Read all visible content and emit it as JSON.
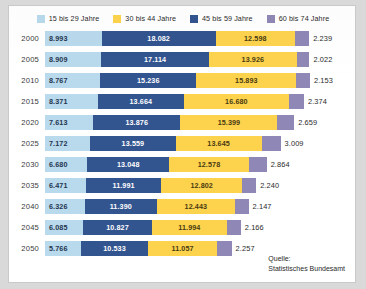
{
  "chart_data": {
    "type": "bar",
    "orientation": "horizontal",
    "stacked": true,
    "title": "",
    "xlabel": "",
    "ylabel": "",
    "categories": [
      "2000",
      "2005",
      "2010",
      "2015",
      "2020",
      "2025",
      "2030",
      "2035",
      "2040",
      "2045",
      "2050"
    ],
    "series": [
      {
        "name": "15 bis 29 Jahre",
        "color": "#b9d9ec",
        "values": [
          8993,
          8909,
          8767,
          8371,
          7613,
          7172,
          6680,
          6471,
          6326,
          6085,
          5766
        ]
      },
      {
        "name": "45 bis 59 Jahre",
        "color": "#32548f",
        "values": [
          18082,
          17114,
          15236,
          13664,
          13876,
          13559,
          13048,
          11991,
          11390,
          10827,
          10533
        ]
      },
      {
        "name": "30 bis 44 Jahre",
        "color": "#fdd34e",
        "values": [
          12598,
          13926,
          15893,
          16680,
          15399,
          13645,
          12578,
          12802,
          12443,
          11994,
          11057
        ]
      },
      {
        "name": "60 bis 74 Jahre",
        "color": "#8f87b5",
        "values": [
          2239,
          2022,
          2153,
          2374,
          2659,
          3009,
          2864,
          2240,
          2147,
          2166,
          2257
        ]
      }
    ],
    "value_labels": {
      "2000": [
        "8.993",
        "18.082",
        "12.598",
        "2.239"
      ],
      "2005": [
        "8.909",
        "17.114",
        "13.926",
        "2.022"
      ],
      "2010": [
        "8.767",
        "15.236",
        "15.893",
        "2.153"
      ],
      "2015": [
        "8.371",
        "13.664",
        "16.680",
        "2.374"
      ],
      "2020": [
        "7.613",
        "13.876",
        "15.399",
        "2.659"
      ],
      "2025": [
        "7.172",
        "13.559",
        "13.645",
        "3.009"
      ],
      "2030": [
        "6.680",
        "13.048",
        "12.578",
        "2.864"
      ],
      "2035": [
        "6.471",
        "11.991",
        "12.802",
        "2.240"
      ],
      "2040": [
        "6.326",
        "11.390",
        "12.443",
        "2.147"
      ],
      "2045": [
        "6.085",
        "10.827",
        "11.994",
        "2.166"
      ],
      "2050": [
        "5.766",
        "10.533",
        "11.057",
        "2.257"
      ]
    },
    "legend_position": "top",
    "grid": false
  },
  "legend": {
    "items": [
      {
        "label": "15 bis 29 Jahre",
        "color": "#b9d9ec"
      },
      {
        "label": "30 bis 44 Jahre",
        "color": "#fdd34e"
      },
      {
        "label": "45 bis 59 Jahre",
        "color": "#32548f"
      },
      {
        "label": "60 bis 74 Jahre",
        "color": "#8f87b5"
      }
    ]
  },
  "source": {
    "line1": "Quelle:",
    "line2": "Statistisches Bundesamt"
  }
}
